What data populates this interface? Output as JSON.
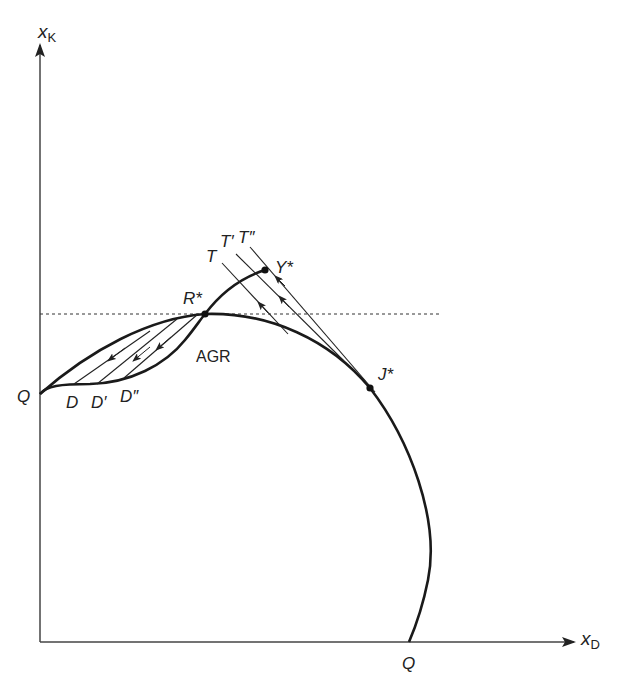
{
  "diagram": {
    "axes": {
      "y_label_main": "x",
      "y_label_sub": "K",
      "x_label_main": "x",
      "x_label_sub": "D"
    },
    "labels": {
      "Q_left": "Q",
      "Q_bottom": "Q",
      "R_star": "R*",
      "Y_star": "Y*",
      "J_star": "J*",
      "AGR": "AGR",
      "T": "T",
      "T_prime": "T′",
      "T_double_prime": "T″",
      "D": "D",
      "D_prime": "D′",
      "D_double_prime": "D″"
    },
    "colors": {
      "line": "#1a1a1a",
      "axis": "#444444",
      "text": "#222222"
    }
  }
}
